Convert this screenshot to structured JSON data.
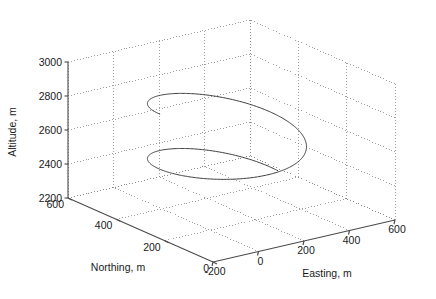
{
  "chart_data": {
    "type": "line",
    "projection": "3d",
    "title": "",
    "xlabel": "Easting, m",
    "ylabel": "Northing, m",
    "zlabel": "Altitude, m",
    "x_ticks": [
      -200,
      0,
      200,
      400,
      600
    ],
    "y_ticks": [
      0,
      200,
      400,
      600
    ],
    "z_ticks": [
      2200,
      2400,
      2600,
      2800,
      3000
    ],
    "x_tick_labels": [
      "-200",
      "0",
      "200",
      "400",
      "600"
    ],
    "y_tick_labels": [
      "0",
      "200",
      "400",
      "600"
    ],
    "z_tick_labels": [
      "2200",
      "2400",
      "2600",
      "2800",
      "3000"
    ],
    "xlim": [
      -200,
      600
    ],
    "ylim": [
      0,
      600
    ],
    "zlim": [
      2200,
      3000
    ],
    "grid": true,
    "legend": null,
    "series": [
      {
        "name": "trajectory",
        "color": "#3a3a3a",
        "description": "descending helical flight path, approx 1.5 turns",
        "geometry": {
          "center_easting": 180,
          "center_northing": 300,
          "radius_easting": 250,
          "radius_northing": 230,
          "start_altitude": 2810,
          "end_altitude": 2340,
          "turns": 1.45,
          "start_angle_deg": 168,
          "direction": "clockwise"
        }
      }
    ]
  },
  "axes": {
    "z_axis_label": "Altitude, m",
    "y_axis_label": "Northing, m",
    "x_axis_label": "Easting, m"
  },
  "colors": {
    "background": "#ffffff",
    "axis": "#4a4a4a",
    "grid": "#8a8a8a",
    "curve": "#3a3a3a",
    "text": "#1a1a1a"
  }
}
